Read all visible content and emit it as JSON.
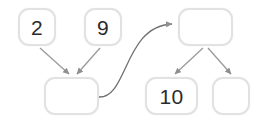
{
  "diagram": {
    "background_color": "#ffffff",
    "node_border_color": "#e2e2e2",
    "node_fill_color": "#ffffff",
    "edge_color": "#9a9a9a",
    "label_color": "#2b2b2b",
    "nodes": [
      {
        "id": "node-2",
        "label": "2",
        "x": 18,
        "y": 8,
        "w": 38,
        "h": 38,
        "empty": false
      },
      {
        "id": "node-9",
        "label": "9",
        "x": 84,
        "y": 8,
        "w": 38,
        "h": 38,
        "empty": false
      },
      {
        "id": "node-left-empty",
        "label": "",
        "x": 44,
        "y": 77,
        "w": 55,
        "h": 38,
        "empty": true
      },
      {
        "id": "node-top-right",
        "label": "",
        "x": 178,
        "y": 8,
        "w": 55,
        "h": 38,
        "empty": true
      },
      {
        "id": "node-10",
        "label": "10",
        "x": 145,
        "y": 77,
        "w": 53,
        "h": 38,
        "empty": false
      },
      {
        "id": "node-bottom-right",
        "label": "",
        "x": 212,
        "y": 77,
        "w": 38,
        "h": 38,
        "empty": true
      }
    ],
    "edges": [
      {
        "id": "edge-2-to-left-empty",
        "from": "node-2",
        "to": "node-left-empty",
        "shape": "straight",
        "path": "M 40 48 L 69 74"
      },
      {
        "id": "edge-9-to-left-empty",
        "from": "node-9",
        "to": "node-left-empty",
        "shape": "straight",
        "path": "M 100 48 L 77 74"
      },
      {
        "id": "edge-left-empty-to-top-right",
        "from": "node-left-empty",
        "to": "node-top-right",
        "shape": "curved",
        "path": "M 99 97 C 128 98 124 26 174 24"
      },
      {
        "id": "edge-top-right-to-10",
        "from": "node-top-right",
        "to": "node-10",
        "shape": "straight",
        "path": "M 203 48 L 174 74"
      },
      {
        "id": "edge-top-right-to-bottom-right",
        "from": "node-top-right",
        "to": "node-bottom-right",
        "shape": "straight",
        "path": "M 208 48 L 232 74"
      }
    ]
  }
}
